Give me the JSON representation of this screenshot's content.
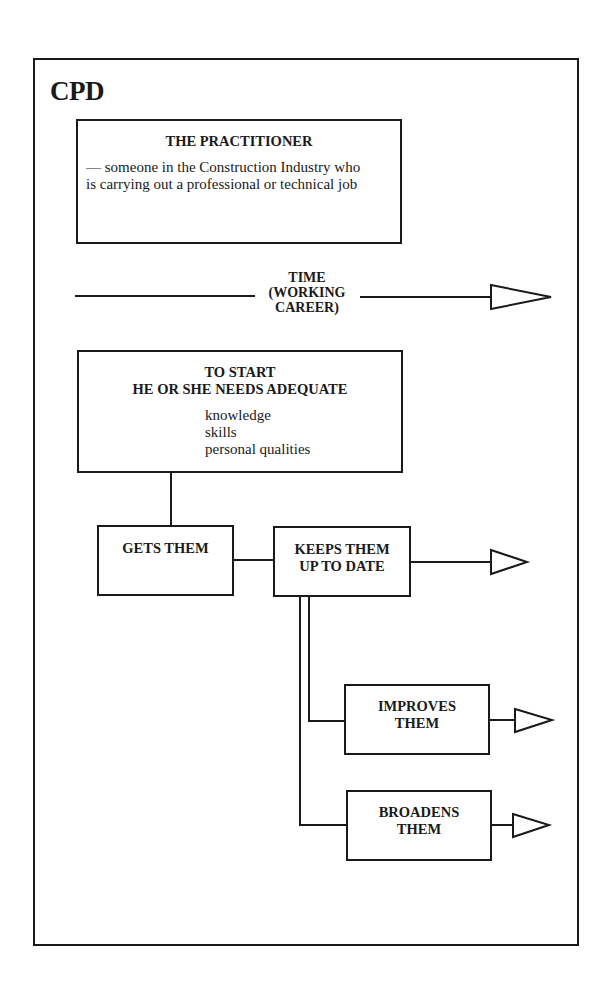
{
  "diagram": {
    "title": "CPD",
    "practitioner": {
      "heading": "THE PRACTITIONER",
      "description": "— someone in the Construction Industry who is carrying out a professional or technical job"
    },
    "timeline": {
      "label_line1": "TIME",
      "label_line2": "(WORKING",
      "label_line3": "CAREER)"
    },
    "start": {
      "heading_line1": "TO START",
      "heading_line2": "HE OR SHE NEEDS ADEQUATE",
      "items": [
        "knowledge",
        "skills",
        "personal qualities"
      ]
    },
    "gets": {
      "label": "GETS THEM"
    },
    "keeps": {
      "label_line1": "KEEPS THEM",
      "label_line2": "UP TO DATE"
    },
    "improves": {
      "label_line1": "IMPROVES",
      "label_line2": "THEM"
    },
    "broadens": {
      "label_line1": "BROADENS",
      "label_line2": "THEM"
    },
    "colors": {
      "line": "#1a1a1a",
      "background": "#ffffff"
    }
  }
}
